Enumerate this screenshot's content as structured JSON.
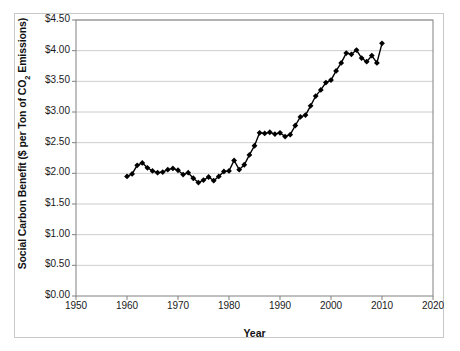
{
  "chart": {
    "title": "",
    "ylabel_prefix": "Social Carbon Benefit ($ per Ton of CO",
    "ylabel_sub": "2",
    "ylabel_suffix": " Emissions)",
    "xlabel": "Year"
  },
  "chart_data": {
    "type": "line",
    "title": "",
    "xlabel": "Year",
    "ylabel": "Social Carbon Benefit ($ per Ton of CO2 Emissions)",
    "xlim": [
      1950,
      2020
    ],
    "ylim": [
      0.0,
      4.5
    ],
    "xticks": [
      1950,
      1960,
      1970,
      1980,
      1990,
      2000,
      2010,
      2020
    ],
    "xtick_labels": [
      "1950",
      "1960",
      "1970",
      "1980",
      "1990",
      "2000",
      "2010",
      "2020"
    ],
    "yticks": [
      0.0,
      0.5,
      1.0,
      1.5,
      2.0,
      2.5,
      3.0,
      3.5,
      4.0,
      4.5
    ],
    "ytick_labels": [
      "$0.00",
      "$0.50",
      "$1.00",
      "$1.50",
      "$2.00",
      "$2.50",
      "$3.00",
      "$3.50",
      "$4.00",
      "$4.50"
    ],
    "grid": "horizontal",
    "legend": "none",
    "marker": "diamond",
    "marker_color": "#000000",
    "line_color": "#000000",
    "x": [
      1960,
      1961,
      1962,
      1963,
      1964,
      1965,
      1966,
      1967,
      1968,
      1969,
      1970,
      1971,
      1972,
      1973,
      1974,
      1975,
      1976,
      1977,
      1978,
      1979,
      1980,
      1981,
      1982,
      1983,
      1984,
      1985,
      1986,
      1987,
      1988,
      1989,
      1990,
      1991,
      1992,
      1993,
      1994,
      1995,
      1996,
      1997,
      1998,
      1999,
      2000,
      2001,
      2002,
      2003,
      2004,
      2005,
      2006,
      2007,
      2008,
      2009,
      2010
    ],
    "values": [
      1.95,
      1.99,
      2.13,
      2.17,
      2.09,
      2.04,
      2.01,
      2.02,
      2.06,
      2.08,
      2.05,
      1.98,
      2.01,
      1.92,
      1.85,
      1.89,
      1.94,
      1.88,
      1.95,
      2.03,
      2.04,
      2.21,
      2.06,
      2.14,
      2.3,
      2.45,
      2.66,
      2.65,
      2.67,
      2.64,
      2.66,
      2.6,
      2.63,
      2.78,
      2.92,
      2.95,
      3.1,
      3.26,
      3.36,
      3.48,
      3.52,
      3.67,
      3.8,
      3.96,
      3.94,
      4.01,
      3.88,
      3.82,
      3.92,
      3.8,
      4.12
    ]
  }
}
